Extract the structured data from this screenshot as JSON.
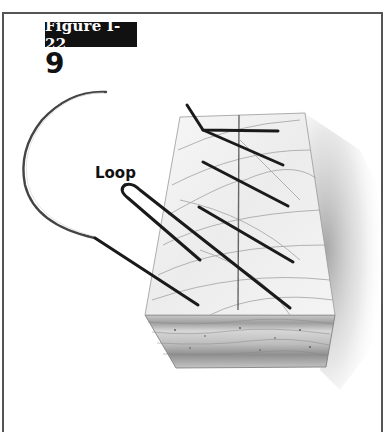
{
  "figure": {
    "label": "Figure I-22",
    "step_number": "9",
    "annotation": "Loop"
  },
  "illustration": {
    "subject": "curved suture needle with thread forming loop through skin block",
    "elements": [
      "frame-border",
      "curved-needle",
      "suture-thread",
      "skin-block-top-surface",
      "skin-block-layers",
      "incision-line",
      "drop-shadow"
    ],
    "colors": {
      "thread": "#1a1a1a",
      "needle": "#555555",
      "skin_surface": "#f2f2f2",
      "skin_layers": "#c8c8c8",
      "frame": "#555555",
      "label_bg": "#111111",
      "label_text": "#ffffff"
    }
  }
}
